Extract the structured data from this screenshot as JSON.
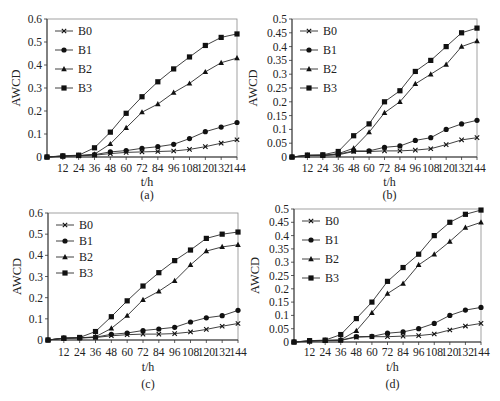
{
  "figure": {
    "panels_count": 4
  },
  "chart_data": [
    {
      "type": "line",
      "panel_label": "(a)",
      "title": "",
      "xlabel": "t/h",
      "ylabel": "AWCD",
      "x": [
        0,
        12,
        24,
        36,
        48,
        60,
        72,
        84,
        96,
        108,
        120,
        132,
        144
      ],
      "x_tick_labels": [
        "12",
        "24",
        "36",
        "48",
        "60",
        "72",
        "84",
        "96",
        "108",
        "120",
        "132",
        "144"
      ],
      "ylim": [
        0,
        0.6
      ],
      "y_ticks": [
        0,
        0.1,
        0.2,
        0.3,
        0.4,
        0.5,
        0.6
      ],
      "y_tick_labels": [
        "0",
        "0.1",
        "0.2",
        "0.3",
        "0.4",
        "0.5",
        "0.6"
      ],
      "grid": false,
      "legend_position": "upper-left-inside",
      "series": [
        {
          "name": "B0",
          "marker": "x",
          "values": [
            0,
            0.003,
            0.005,
            0.008,
            0.015,
            0.02,
            0.022,
            0.024,
            0.026,
            0.033,
            0.045,
            0.06,
            0.075
          ]
        },
        {
          "name": "B1",
          "marker": "circle",
          "values": [
            0,
            0.004,
            0.006,
            0.01,
            0.022,
            0.028,
            0.038,
            0.045,
            0.055,
            0.08,
            0.11,
            0.13,
            0.15
          ]
        },
        {
          "name": "B2",
          "marker": "triangle",
          "values": [
            0,
            0.004,
            0.006,
            0.012,
            0.057,
            0.127,
            0.195,
            0.23,
            0.28,
            0.32,
            0.37,
            0.41,
            0.43
          ]
        },
        {
          "name": "B3",
          "marker": "square",
          "values": [
            0,
            0.005,
            0.008,
            0.04,
            0.108,
            0.19,
            0.262,
            0.327,
            0.383,
            0.435,
            0.485,
            0.52,
            0.535
          ]
        }
      ],
      "frame": {
        "left": 47,
        "right": 237,
        "top": 19,
        "bottom": 157
      },
      "label_y": {
        "ticks": 168,
        "xlabel": 182,
        "panel": 195
      }
    },
    {
      "type": "line",
      "panel_label": "(b)",
      "title": "",
      "xlabel": "t/h",
      "ylabel": "AWCD",
      "x": [
        0,
        12,
        24,
        36,
        48,
        60,
        72,
        84,
        96,
        108,
        120,
        132,
        144
      ],
      "x_tick_labels": [
        "12",
        "24",
        "36",
        "48",
        "60",
        "72",
        "84",
        "96",
        "108",
        "120",
        "132",
        "144"
      ],
      "ylim": [
        0,
        0.5
      ],
      "y_ticks": [
        0,
        0.05,
        0.1,
        0.15,
        0.2,
        0.25,
        0.3,
        0.35,
        0.4,
        0.45,
        0.5
      ],
      "y_tick_labels": [
        "0",
        "0.05",
        "0.1",
        "0.15",
        "0.2",
        "0.25",
        "0.3",
        "0.35",
        "0.4",
        "0.45",
        "0.5"
      ],
      "grid": false,
      "legend_position": "upper-left-inside",
      "series": [
        {
          "name": "B0",
          "marker": "x",
          "values": [
            0,
            0.005,
            0.005,
            0.008,
            0.02,
            0.02,
            0.022,
            0.022,
            0.025,
            0.03,
            0.045,
            0.062,
            0.07
          ]
        },
        {
          "name": "B1",
          "marker": "circle",
          "values": [
            0,
            0.006,
            0.006,
            0.01,
            0.022,
            0.022,
            0.035,
            0.04,
            0.06,
            0.07,
            0.1,
            0.12,
            0.133
          ]
        },
        {
          "name": "B2",
          "marker": "triangle",
          "values": [
            0,
            0.005,
            0.006,
            0.012,
            0.032,
            0.09,
            0.16,
            0.2,
            0.265,
            0.3,
            0.335,
            0.4,
            0.42
          ]
        },
        {
          "name": "B3",
          "marker": "square",
          "values": [
            0,
            0.007,
            0.008,
            0.02,
            0.077,
            0.12,
            0.2,
            0.24,
            0.31,
            0.35,
            0.4,
            0.45,
            0.467
          ]
        }
      ],
      "frame": {
        "left": 292,
        "right": 477,
        "top": 19,
        "bottom": 157
      },
      "label_y": {
        "ticks": 168,
        "xlabel": 182,
        "panel": 195
      }
    },
    {
      "type": "line",
      "panel_label": "(c)",
      "title": "",
      "xlabel": "t/h",
      "ylabel": "AWCD",
      "x": [
        0,
        12,
        24,
        36,
        48,
        60,
        72,
        84,
        96,
        108,
        120,
        132,
        144
      ],
      "x_tick_labels": [
        "12",
        "24",
        "36",
        "48",
        "60",
        "72",
        "84",
        "96",
        "108",
        "120",
        "132",
        "144"
      ],
      "ylim": [
        0,
        0.6
      ],
      "y_ticks": [
        0,
        0.1,
        0.2,
        0.3,
        0.4,
        0.5,
        0.6
      ],
      "y_tick_labels": [
        "0",
        "0.1",
        "0.2",
        "0.3",
        "0.4",
        "0.5",
        "0.6"
      ],
      "grid": false,
      "legend_position": "upper-left-inside",
      "series": [
        {
          "name": "B0",
          "marker": "x",
          "values": [
            0,
            0.008,
            0.01,
            0.012,
            0.02,
            0.025,
            0.028,
            0.028,
            0.03,
            0.038,
            0.05,
            0.065,
            0.078
          ]
        },
        {
          "name": "B1",
          "marker": "circle",
          "values": [
            0,
            0.009,
            0.01,
            0.013,
            0.027,
            0.033,
            0.045,
            0.052,
            0.06,
            0.085,
            0.105,
            0.115,
            0.14
          ]
        },
        {
          "name": "B2",
          "marker": "triangle",
          "values": [
            0,
            0.008,
            0.01,
            0.015,
            0.055,
            0.115,
            0.19,
            0.23,
            0.28,
            0.355,
            0.42,
            0.44,
            0.45
          ]
        },
        {
          "name": "B3",
          "marker": "square",
          "values": [
            0,
            0.009,
            0.012,
            0.04,
            0.11,
            0.185,
            0.255,
            0.318,
            0.375,
            0.425,
            0.48,
            0.5,
            0.51
          ]
        }
      ],
      "frame": {
        "left": 48,
        "right": 238,
        "top": 213,
        "bottom": 340
      },
      "label_y": {
        "ticks": 352,
        "xlabel": 367,
        "panel": 384
      }
    },
    {
      "type": "line",
      "panel_label": "(d)",
      "title": "",
      "xlabel": "t/h",
      "ylabel": "AWCD",
      "x": [
        0,
        12,
        24,
        36,
        48,
        60,
        72,
        84,
        96,
        108,
        120,
        132,
        144
      ],
      "x_tick_labels": [
        "12",
        "24",
        "36",
        "48",
        "60",
        "72",
        "84",
        "96",
        "108",
        "120",
        "132",
        "144"
      ],
      "ylim": [
        0,
        0.5
      ],
      "y_ticks": [
        0,
        0.05,
        0.1,
        0.15,
        0.2,
        0.25,
        0.3,
        0.35,
        0.4,
        0.45,
        0.5
      ],
      "y_tick_labels": [
        "0",
        "0.05",
        "0.1",
        "0.15",
        "0.2",
        "0.25",
        "0.3",
        "0.35",
        "0.4",
        "0.45",
        "0.5"
      ],
      "grid": false,
      "legend_position": "upper-left-inside",
      "series": [
        {
          "name": "B0",
          "marker": "x",
          "values": [
            0,
            0.003,
            0.005,
            0.006,
            0.018,
            0.02,
            0.02,
            0.022,
            0.024,
            0.03,
            0.045,
            0.06,
            0.07
          ]
        },
        {
          "name": "B1",
          "marker": "circle",
          "values": [
            0,
            0.004,
            0.006,
            0.007,
            0.02,
            0.021,
            0.033,
            0.038,
            0.05,
            0.07,
            0.1,
            0.12,
            0.13
          ]
        },
        {
          "name": "B2",
          "marker": "triangle",
          "values": [
            0,
            0.004,
            0.006,
            0.008,
            0.042,
            0.11,
            0.182,
            0.22,
            0.29,
            0.33,
            0.378,
            0.43,
            0.45
          ]
        },
        {
          "name": "B3",
          "marker": "square",
          "values": [
            0,
            0.005,
            0.007,
            0.028,
            0.088,
            0.15,
            0.228,
            0.28,
            0.33,
            0.4,
            0.45,
            0.48,
            0.496
          ]
        }
      ],
      "frame": {
        "left": 294,
        "right": 481,
        "top": 209,
        "bottom": 342
      },
      "label_y": {
        "ticks": 352,
        "xlabel": 367,
        "panel": 384
      }
    }
  ],
  "style": {
    "line_color": "#2b2b2b",
    "marker_color": "#111111",
    "axis_color": "#333333",
    "background": "#ffffff"
  }
}
